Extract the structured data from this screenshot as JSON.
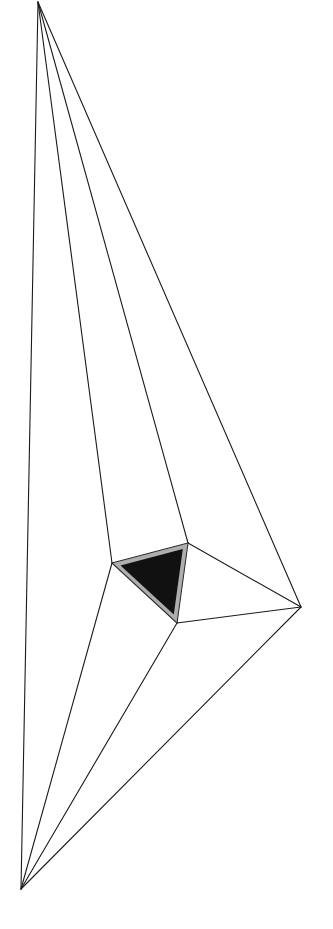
{
  "artwork": {
    "background": "#ffffff",
    "stroke_color": "#1a1a1a",
    "core_color": "#111111",
    "vertices": {
      "apex": [
        38,
        2
      ],
      "bottom": [
        21,
        889
      ],
      "right": [
        301,
        607
      ],
      "core_left": [
        112,
        563
      ],
      "core_top_right": [
        188,
        543
      ],
      "core_bottom": [
        177,
        623
      ]
    },
    "edges": [
      [
        "apex",
        "bottom"
      ],
      [
        "apex",
        "core_left"
      ],
      [
        "apex",
        "core_top_right"
      ],
      [
        "apex",
        "right"
      ],
      [
        "bottom",
        "core_left"
      ],
      [
        "bottom",
        "core_bottom"
      ],
      [
        "bottom",
        "right"
      ],
      [
        "core_top_right",
        "right"
      ],
      [
        "core_bottom",
        "right"
      ],
      [
        "core_left",
        "core_top_right"
      ],
      [
        "core_top_right",
        "core_bottom"
      ],
      [
        "core_bottom",
        "core_left"
      ]
    ],
    "shaded_face": [
      "core_left",
      "core_top_right",
      "core_bottom"
    ]
  }
}
